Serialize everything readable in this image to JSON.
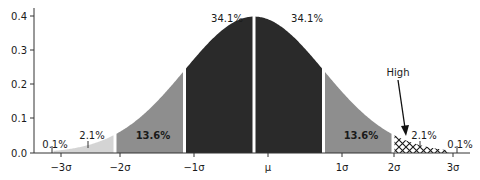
{
  "chart_data": {
    "type": "area",
    "title": "",
    "xlabel": "",
    "ylabel": "",
    "ylim": [
      0.0,
      0.4
    ],
    "yticks": [
      "0.0",
      "0.1",
      "0.2",
      "0.3",
      "0.4"
    ],
    "xticks": [
      "−3σ",
      "−2σ",
      "−1σ",
      "μ",
      "1σ",
      "2σ",
      "3σ"
    ],
    "grid": false,
    "distribution": "normal",
    "regions": [
      {
        "name": "left-tail-3",
        "from": -4,
        "to": -3,
        "label": "0.1%",
        "fill": "#ffffff"
      },
      {
        "name": "left-tail-2",
        "from": -3,
        "to": -2,
        "label": "2.1%",
        "fill": "#d0d0d0"
      },
      {
        "name": "left-band-1",
        "from": -2,
        "to": -1,
        "label": "13.6%",
        "fill": "#8c8c8c"
      },
      {
        "name": "center-left",
        "from": -1,
        "to": 0,
        "label": "34.1%",
        "fill": "#2b2b2b"
      },
      {
        "name": "center-right",
        "from": 0,
        "to": 1,
        "label": "34.1%",
        "fill": "#2b2b2b"
      },
      {
        "name": "right-band-1",
        "from": 1,
        "to": 2,
        "label": "13.6%",
        "fill": "#8c8c8c"
      },
      {
        "name": "right-tail-2",
        "from": 2,
        "to": 3,
        "label": "2.1%",
        "fill": "hatch"
      },
      {
        "name": "right-tail-3",
        "from": 3,
        "to": 4,
        "label": "0.1%",
        "fill": "#ffffff"
      }
    ],
    "annotations": [
      {
        "text": "High",
        "points_to": "right-tail-2"
      }
    ]
  },
  "labels": {
    "p01_left": "0.1%",
    "p21_left": "2.1%",
    "p136_left": "13.6%",
    "p341_left": "34.1%",
    "p341_right": "34.1%",
    "p136_right": "13.6%",
    "p21_right": "2.1%",
    "p01_right": "0.1%",
    "high": "High"
  },
  "axis": {
    "y0": "0.0",
    "y1": "0.1",
    "y2": "0.2",
    "y3": "0.3",
    "y4": "0.4",
    "xm3": "−3σ",
    "xm2": "−2σ",
    "xm1": "−1σ",
    "xmu": "μ",
    "xp1": "1σ",
    "xp2": "2σ",
    "xp3": "3σ"
  }
}
